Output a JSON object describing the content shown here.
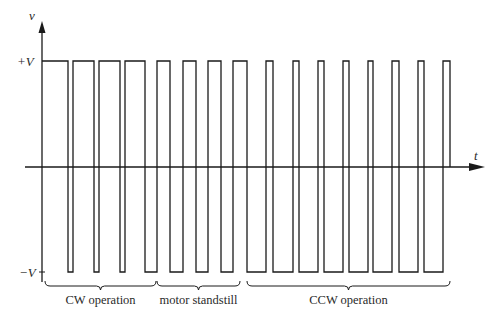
{
  "axes": {
    "y_label": "v",
    "x_label": "t",
    "pos_level_label": "+V",
    "neg_level_label": "−V"
  },
  "waveform": {
    "description": "Bipolar square-wave drive signal; levels +V and -V",
    "start_level": "high",
    "transitions": [
      68,
      73,
      94,
      99,
      120,
      125,
      145,
      157,
      170,
      183,
      196,
      208,
      221,
      233,
      247,
      266,
      273,
      293,
      299,
      318,
      324,
      343,
      349,
      368,
      373,
      392,
      399,
      418,
      424,
      443
    ],
    "start_time": 42,
    "end_time": 450,
    "end_level": "zero"
  },
  "segments": [
    {
      "label": "CW operation",
      "from": 45,
      "to": 156
    },
    {
      "label": "motor standstill",
      "from": 157,
      "to": 240
    },
    {
      "label": "CCW operation",
      "from": 247,
      "to": 450
    }
  ],
  "colors": {
    "line": "#1a1a1a",
    "text": "#2a2a2a"
  }
}
